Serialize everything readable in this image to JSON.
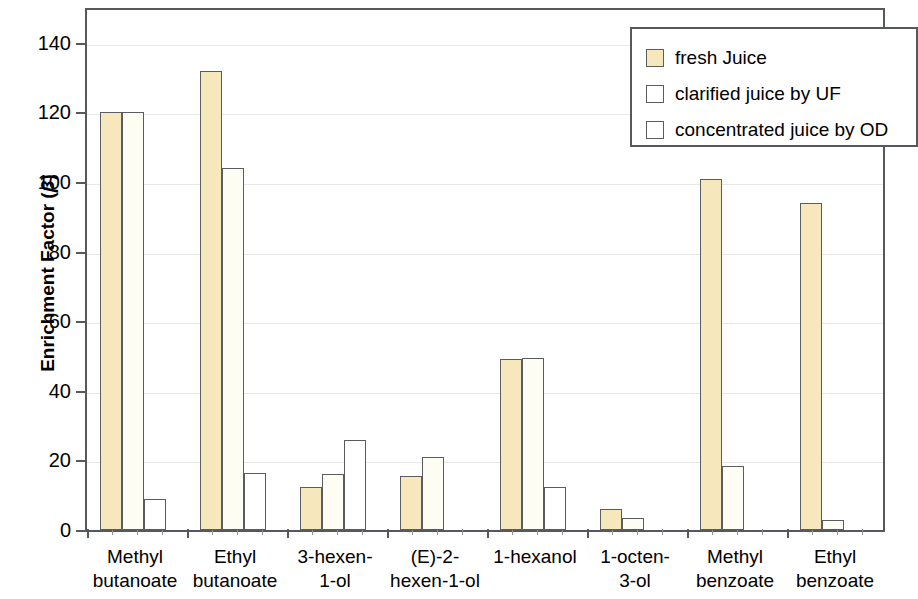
{
  "chart_data": {
    "type": "bar",
    "title": "",
    "xlabel": "",
    "ylabel": "Enrichment Factor (β)",
    "ylabel_text": "Enrichment Factor (",
    "ylabel_symbol": "β",
    "ylabel_suffix": ")",
    "ylim": [
      0,
      150
    ],
    "yticks": [
      0,
      20,
      40,
      60,
      80,
      100,
      120,
      140
    ],
    "ytick_labels": [
      "0",
      "20",
      "40",
      "60",
      "80",
      "100",
      "120",
      "140"
    ],
    "grid": true,
    "legend_position": "top-right",
    "categories": [
      "Methyl butanoate",
      "Ethyl butanoate",
      "3-hexen-1-ol",
      "(E)-2-hexen-1-ol",
      "1-hexanol",
      "1-octen-3-ol",
      "Methyl benzoate",
      "Ethyl benzoate"
    ],
    "category_lines": [
      [
        "Methyl",
        "butanoate"
      ],
      [
        "Ethyl",
        "butanoate"
      ],
      [
        "3-hexen-",
        "1-ol"
      ],
      [
        "(E)-2-",
        "hexen-1-ol"
      ],
      [
        "1-hexanol",
        ""
      ],
      [
        "1-octen-",
        "3-ol"
      ],
      [
        "Methyl",
        "benzoate"
      ],
      [
        "Ethyl",
        "benzoate"
      ]
    ],
    "series": [
      {
        "name": "fresh Juice",
        "color": "#f7e7bd",
        "values": [
          120,
          132,
          12.5,
          15.5,
          49,
          6,
          101,
          94
        ]
      },
      {
        "name": "clarified juice by UF",
        "color": "#fdfdf4",
        "values": [
          120,
          104,
          16,
          21,
          49.5,
          3.5,
          18.5,
          3
        ]
      },
      {
        "name": "concentrated juice by OD",
        "color": "#ffffff",
        "values": [
          9,
          16.5,
          26,
          0,
          12.5,
          0,
          0,
          0
        ]
      }
    ]
  },
  "legend": {
    "items": [
      {
        "label": "fresh Juice",
        "swatch": "filled-beige-swatch"
      },
      {
        "label": "clarified juice by UF",
        "swatch": "white-swatch"
      },
      {
        "label": "concentrated juice by OD",
        "swatch": "white-swatch"
      }
    ]
  }
}
